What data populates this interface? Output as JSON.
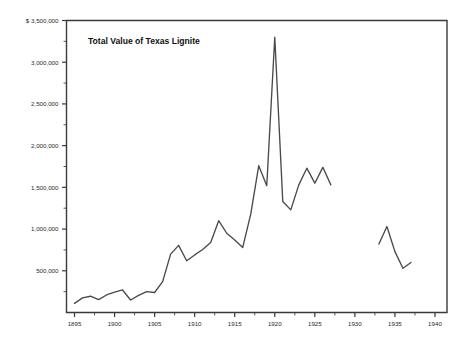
{
  "chart_data": {
    "type": "line",
    "title": "Total Value of Texas Lignite",
    "xlabel": "",
    "ylabel": "",
    "y_axis_prefix": "$",
    "xlim": [
      1894.0,
      1941.5
    ],
    "ylim": [
      0,
      3500000
    ],
    "grid": false,
    "legend": null,
    "x_ticks": [
      1895,
      1900,
      1905,
      1910,
      1915,
      1920,
      1925,
      1930,
      1935,
      1940
    ],
    "x_tick_labels": [
      "1895",
      "1900",
      "1905",
      "1910",
      "1915",
      "1920",
      "1925",
      "1930",
      "1935",
      "1940"
    ],
    "x_minor_tick_interval": 2.5,
    "y_ticks": [
      500000,
      1000000,
      1500000,
      2000000,
      2500000,
      3000000,
      3500000
    ],
    "y_tick_labels": [
      "500,000",
      "1,000,000",
      "1,500,000",
      "2,000,000",
      "2,500,000",
      "3,000,000",
      "$ 3,500,000"
    ],
    "y_minor_tick_interval": 250000,
    "line_color": "#4a4a4a",
    "series": [
      {
        "name": "Total Value of Texas Lignite",
        "segment": "1895-1927",
        "x": [
          1895,
          1896,
          1897,
          1898,
          1899,
          1900,
          1901,
          1902,
          1903,
          1904,
          1905,
          1906,
          1907,
          1908,
          1909,
          1910,
          1911,
          1912,
          1913,
          1914,
          1915,
          1916,
          1917,
          1918,
          1919,
          1920,
          1921,
          1922,
          1923,
          1924,
          1925,
          1926,
          1927
        ],
        "values": [
          110000,
          175000,
          195000,
          155000,
          210000,
          245000,
          270000,
          150000,
          205000,
          250000,
          240000,
          370000,
          700000,
          805000,
          620000,
          690000,
          755000,
          840000,
          1100000,
          950000,
          870000,
          780000,
          1180000,
          1760000,
          1520000,
          3300000,
          1330000,
          1230000,
          1530000,
          1730000,
          1550000,
          1740000,
          1530000
        ]
      },
      {
        "name": "Total Value of Texas Lignite",
        "segment": "1933-1938",
        "x": [
          1933,
          1934,
          1935,
          1936,
          1937
        ],
        "values": [
          820000,
          1030000,
          730000,
          530000,
          600000
        ]
      }
    ]
  },
  "plot": {
    "frame_color": "#3a3a3a",
    "background": "#ffffff"
  }
}
